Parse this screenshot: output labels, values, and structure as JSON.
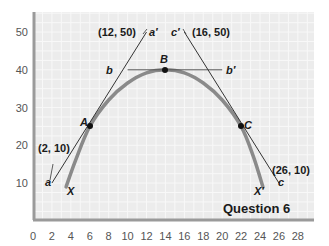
{
  "chart_data": {
    "type": "line",
    "title": "Question 6",
    "xlabel": "",
    "ylabel": "",
    "xlim": [
      0,
      29.5
    ],
    "ylim": [
      0,
      55
    ],
    "grid": true,
    "x_ticks": [
      0,
      2,
      4,
      6,
      8,
      10,
      12,
      14,
      16,
      18,
      20,
      22,
      24,
      26,
      28
    ],
    "y_ticks": [
      10,
      20,
      30,
      40,
      50
    ],
    "series": [
      {
        "name": "XX' curve",
        "label_start": "X",
        "label_end": "X'",
        "points": [
          [
            3.5,
            9
          ],
          [
            4.5,
            16
          ],
          [
            6,
            25
          ],
          [
            8,
            32
          ],
          [
            10,
            36.5
          ],
          [
            12,
            39.2
          ],
          [
            14,
            40
          ],
          [
            16,
            39.2
          ],
          [
            18,
            36.5
          ],
          [
            20,
            32
          ],
          [
            22,
            25
          ],
          [
            23.3,
            17
          ],
          [
            24.3,
            9
          ]
        ],
        "color": "#8a8a8a"
      },
      {
        "name": "Tangent aa'",
        "label_start": "a",
        "label_end": "a'",
        "points": [
          [
            2,
            10
          ],
          [
            12,
            50
          ]
        ],
        "color": "#333333"
      },
      {
        "name": "Tangent bb'",
        "label_start": "b",
        "label_end": "b'",
        "points": [
          [
            10,
            40
          ],
          [
            20,
            40
          ]
        ],
        "color": "#555555"
      },
      {
        "name": "Tangent cc'",
        "label_start": "c",
        "label_end": "c'",
        "points": [
          [
            26,
            10
          ],
          [
            16,
            50
          ]
        ],
        "color": "#333333"
      }
    ],
    "points": [
      {
        "label": "A",
        "x": 6,
        "y": 25
      },
      {
        "label": "B",
        "x": 14,
        "y": 40
      },
      {
        "label": "C",
        "x": 22,
        "y": 25
      }
    ],
    "annotations": [
      {
        "text": "(12, 50)",
        "x": 12,
        "y": 50
      },
      {
        "text": "(16, 50)",
        "x": 16,
        "y": 50
      },
      {
        "text": "(2, 10)",
        "x": 2,
        "y": 10
      },
      {
        "text": "(26, 10)",
        "x": 26,
        "y": 10
      }
    ]
  },
  "labels": {
    "title": "Question 6",
    "A": "A",
    "B": "B",
    "C": "C",
    "a": "a",
    "a_prime": "a′",
    "b": "b",
    "b_prime": "b′",
    "c": "c",
    "c_prime": "c′",
    "X": "X",
    "X_prime": "X′",
    "coord_12_50": "(12, 50)",
    "coord_16_50": "(16, 50)",
    "coord_2_10": "(2, 10)",
    "coord_26_10": "(26, 10)"
  },
  "ticks": {
    "x": [
      "0",
      "2",
      "4",
      "6",
      "8",
      "10",
      "12",
      "14",
      "16",
      "18",
      "20",
      "22",
      "24",
      "26",
      "28"
    ],
    "y": [
      "10",
      "20",
      "30",
      "40",
      "50"
    ]
  }
}
